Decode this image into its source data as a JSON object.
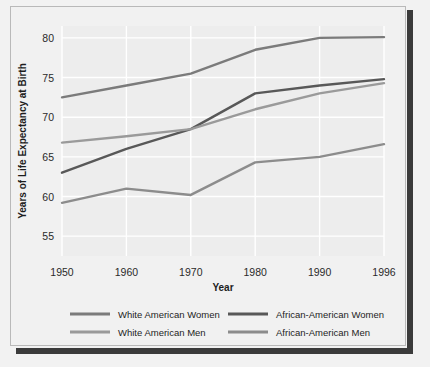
{
  "chart_data": {
    "type": "line",
    "title": "",
    "xlabel": "Year",
    "ylabel": "Years of Life Expectancy at Birth",
    "x": [
      1950,
      1960,
      1970,
      1980,
      1990,
      1996
    ],
    "xtick_labels": [
      "1950",
      "1960",
      "1970",
      "1980",
      "1990",
      "1996"
    ],
    "ytick_labels": [
      "55",
      "60",
      "65",
      "70",
      "75",
      "80"
    ],
    "yticks": [
      55,
      60,
      65,
      70,
      75,
      80
    ],
    "ylim": [
      52.5,
      81.5
    ],
    "grid": true,
    "legend_position": "bottom",
    "series": [
      {
        "name": "White American Women",
        "color": "#7b7b7b",
        "values": [
          72.5,
          74.0,
          75.5,
          78.5,
          80.0,
          80.1
        ]
      },
      {
        "name": "African-American Women",
        "color": "#585858",
        "values": [
          63.0,
          66.0,
          68.5,
          73.0,
          74.0,
          74.8
        ]
      },
      {
        "name": "White American Men",
        "color": "#9a9a9a",
        "values": [
          66.8,
          67.6,
          68.5,
          71.0,
          73.0,
          74.3
        ]
      },
      {
        "name": "African-American Men",
        "color": "#8c8c8c",
        "values": [
          59.2,
          61.0,
          60.2,
          64.3,
          65.0,
          66.6
        ]
      }
    ]
  },
  "legend": {
    "entries": [
      {
        "label": "White American Women",
        "color": "#7b7b7b"
      },
      {
        "label": "African-American Women",
        "color": "#585858"
      },
      {
        "label": "White American Men",
        "color": "#9a9a9a"
      },
      {
        "label": "African-American Men",
        "color": "#8c8c8c"
      }
    ]
  },
  "colors": {
    "page_background": "#f2f2f2",
    "frame_background": "#f1f1f1",
    "plot_background": "#ededed",
    "gridline": "#ffffff",
    "shadow": "#3b3b3b",
    "text": "#1d1d1d"
  }
}
